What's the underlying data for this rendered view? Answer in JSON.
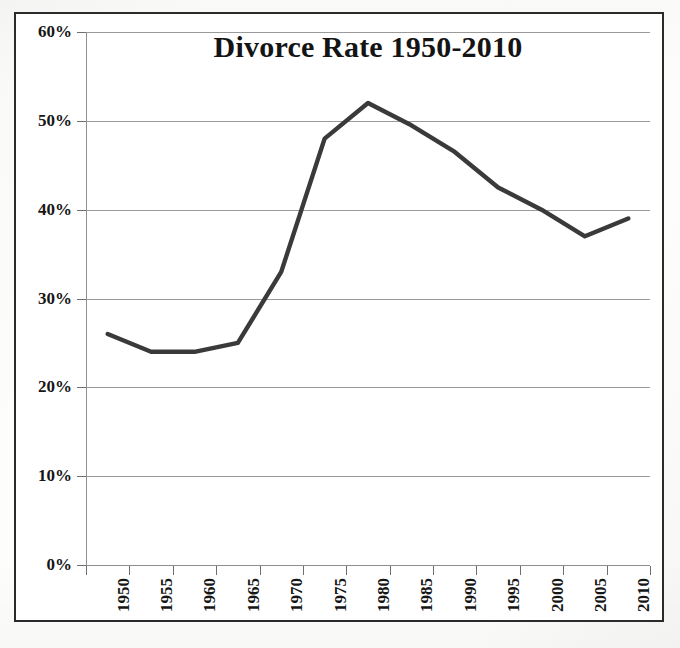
{
  "figure": {
    "title": "Divorce Rate 1950-2010",
    "border_color": "#2b2b2b",
    "background_color": "#ffffff",
    "line_color": "#3a3a3a",
    "gridline_color": "#9a9a9a"
  },
  "chart_data": {
    "type": "line",
    "title": "Divorce Rate 1950-2010",
    "xlabel": "",
    "ylabel": "",
    "categories": [
      "1950",
      "1955",
      "1960",
      "1965",
      "1970",
      "1975",
      "1980",
      "1985",
      "1990",
      "1995",
      "2000",
      "2005",
      "2010"
    ],
    "x": [
      1950,
      1955,
      1960,
      1965,
      1970,
      1975,
      1980,
      1985,
      1990,
      1995,
      2000,
      2005,
      2010
    ],
    "values": [
      26.0,
      24.0,
      24.0,
      25.0,
      33.0,
      48.0,
      52.0,
      49.5,
      46.5,
      42.5,
      40.0,
      37.0,
      39.0
    ],
    "series": [
      {
        "name": "Divorce Rate",
        "values": [
          26.0,
          24.0,
          24.0,
          25.0,
          33.0,
          48.0,
          52.0,
          49.5,
          46.5,
          42.5,
          40.0,
          37.0,
          39.0
        ]
      }
    ],
    "ylim": [
      0,
      60
    ],
    "ytick_values": [
      0,
      10,
      20,
      30,
      40,
      50,
      60
    ],
    "ytick_labels": [
      "0%",
      "10%",
      "20%",
      "30%",
      "40%",
      "50%",
      "60%"
    ],
    "xtick_labels": [
      "1950",
      "1955",
      "1960",
      "1965",
      "1970",
      "1975",
      "1980",
      "1985",
      "1990",
      "1995",
      "2000",
      "2005",
      "2010"
    ],
    "grid": true,
    "grid_axis": "y",
    "legend": false,
    "legend_position": "none",
    "units": "percent",
    "marker": "none",
    "line_width": 4
  }
}
